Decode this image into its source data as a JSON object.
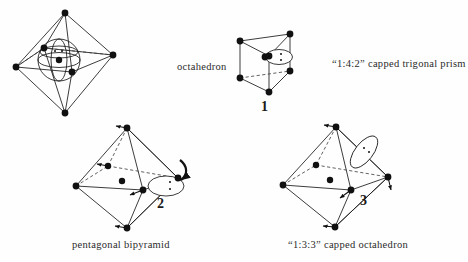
{
  "figure": {
    "background_color": "#fefefe",
    "ink_color": "#1a1a1a",
    "dashed_color": "#3a3a3a"
  },
  "captions": {
    "octahedron": "octahedron",
    "capped_trigonal_prism": "“1:4:2” capped trigonal prism",
    "pentagonal_bipyramid": "pentagonal bipyramid",
    "capped_octahedron": "“1:3:3” capped octahedron"
  },
  "numerals": {
    "one": "1",
    "two": "2",
    "three": "3"
  },
  "structures": [
    {
      "id": "octahedron",
      "name": "octahedron",
      "numeral": null,
      "caption": "octahedron",
      "vertex_count": 6,
      "central_atom": true,
      "lone_pair_shape": "sphere",
      "lone_pair_dots": 2,
      "distortion_arrows": 0
    },
    {
      "id": "capped-trigonal-prism",
      "name": "“1:4:2” capped trigonal prism",
      "numeral": "1",
      "caption": "“1:4:2” capped trigonal prism",
      "vertex_count": 6,
      "central_atom": true,
      "lone_pair_shape": "horizontal-lobe",
      "lone_pair_dots": 2,
      "distortion_arrows": 0
    },
    {
      "id": "pentagonal-bipyramid",
      "name": "pentagonal bipyramid",
      "numeral": "2",
      "caption": "pentagonal bipyramid",
      "vertex_count": 6,
      "central_atom": true,
      "lone_pair_shape": "horizontal-lobe",
      "lone_pair_dots": 2,
      "distortion_arrows": 5
    },
    {
      "id": "capped-octahedron",
      "name": "“1:3:3” capped octahedron",
      "numeral": "3",
      "caption": "“1:3:3” capped octahedron",
      "vertex_count": 6,
      "central_atom": true,
      "lone_pair_shape": "tilted-lobe",
      "lone_pair_dots": 2,
      "distortion_arrows": 4
    }
  ]
}
